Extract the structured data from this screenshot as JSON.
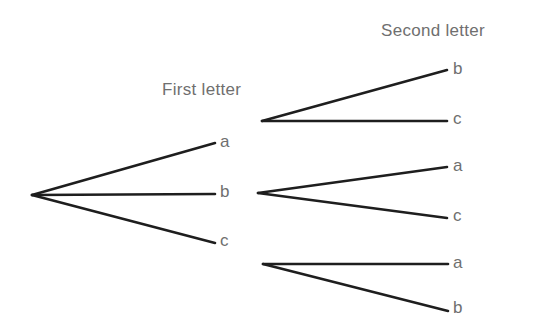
{
  "diagram": {
    "type": "tree",
    "headings": {
      "first": "First letter",
      "second": "Second letter"
    },
    "line_color": "#1e1e1e",
    "text_color": "#6f6f6f",
    "root": {
      "x": 32,
      "y": 195
    },
    "first_level": [
      {
        "label": "a",
        "end": {
          "x": 215,
          "y": 143
        }
      },
      {
        "label": "b",
        "end": {
          "x": 215,
          "y": 194
        }
      },
      {
        "label": "c",
        "end": {
          "x": 215,
          "y": 243
        }
      }
    ],
    "second_level": [
      {
        "parent": "a",
        "origin": {
          "x": 262,
          "y": 121
        },
        "branches": [
          {
            "label": "b",
            "end": {
              "x": 447,
              "y": 70
            }
          },
          {
            "label": "c",
            "end": {
              "x": 447,
              "y": 121
            }
          }
        ]
      },
      {
        "parent": "b",
        "origin": {
          "x": 258,
          "y": 193
        },
        "branches": [
          {
            "label": "a",
            "end": {
              "x": 447,
              "y": 167
            }
          },
          {
            "label": "c",
            "end": {
              "x": 447,
              "y": 218
            }
          }
        ]
      },
      {
        "parent": "c",
        "origin": {
          "x": 263,
          "y": 264
        },
        "branches": [
          {
            "label": "a",
            "end": {
              "x": 448,
              "y": 264
            }
          },
          {
            "label": "b",
            "end": {
              "x": 448,
              "y": 311
            }
          }
        ]
      }
    ]
  }
}
